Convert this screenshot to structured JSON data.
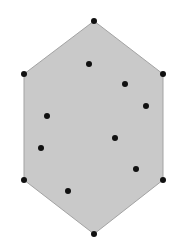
{
  "diagram": {
    "type": "convex-hull",
    "width": 195,
    "height": 243,
    "colors": {
      "background": "#ffffff",
      "hull_fill": "#c9c9c9",
      "hull_stroke": "#a3a3a3",
      "point": "#111111"
    },
    "point_radius": 3,
    "hull_vertices": [
      {
        "x": 94,
        "y": 21
      },
      {
        "x": 163,
        "y": 74
      },
      {
        "x": 163,
        "y": 180
      },
      {
        "x": 94,
        "y": 234
      },
      {
        "x": 24,
        "y": 180
      },
      {
        "x": 24,
        "y": 74
      }
    ],
    "interior_points": [
      {
        "x": 89,
        "y": 64
      },
      {
        "x": 125,
        "y": 84
      },
      {
        "x": 146,
        "y": 106
      },
      {
        "x": 47,
        "y": 116
      },
      {
        "x": 115,
        "y": 138
      },
      {
        "x": 41,
        "y": 148
      },
      {
        "x": 136,
        "y": 169
      },
      {
        "x": 68,
        "y": 191
      }
    ]
  }
}
